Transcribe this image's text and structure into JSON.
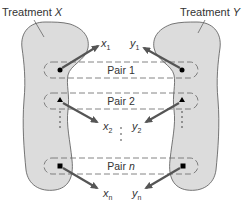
{
  "diagram": {
    "type": "paired-comparison-design",
    "colors": {
      "blob_fill": "#dcdcdc",
      "blob_stroke": "#555555",
      "arrow": "#555555",
      "dashed_box": "#666666",
      "text": "#333333",
      "background": "#ffffff"
    },
    "groups": [
      {
        "id": "treatment-x",
        "label_prefix": "Treatment ",
        "label_var": "X",
        "side": "left"
      },
      {
        "id": "treatment-y",
        "label_prefix": "Treatment ",
        "label_var": "Y",
        "side": "right"
      }
    ],
    "pairs": [
      {
        "label_prefix": "Pair ",
        "label_index": "1",
        "marker": "circle",
        "x_out": {
          "var": "x",
          "sub": "1"
        },
        "y_out": {
          "var": "y",
          "sub": "1"
        }
      },
      {
        "label_prefix": "Pair ",
        "label_index": "2",
        "marker": "triangle",
        "x_out": {
          "var": "x",
          "sub": "2"
        },
        "y_out": {
          "var": "y",
          "sub": "2"
        }
      },
      {
        "label_prefix": "Pair ",
        "label_index": "n",
        "marker": "square",
        "x_out": {
          "var": "x",
          "sub": "n"
        },
        "y_out": {
          "var": "y",
          "sub": "n"
        }
      }
    ],
    "ellipsis": "⋮"
  }
}
